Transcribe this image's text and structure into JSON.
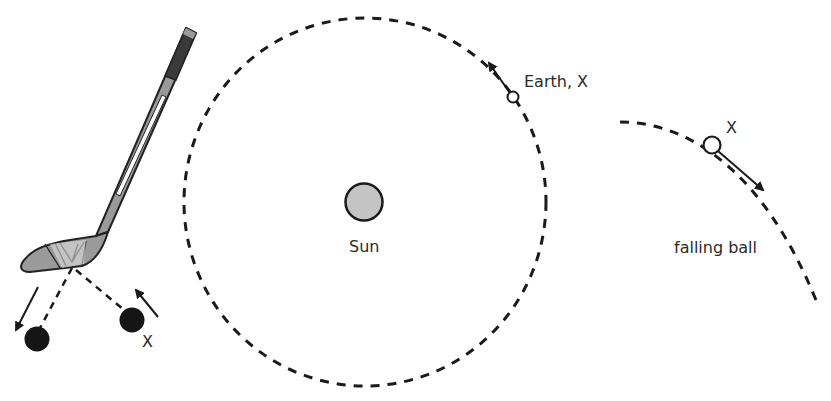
{
  "diagram": {
    "colors": {
      "line": "#1a1a1a",
      "sun_fill": "#c4c4c4",
      "stick_blade": "#9a9a9a",
      "stick_grip": "#3a3a3a",
      "text": "#2a2a2a"
    },
    "hockey": {
      "puck_x_label": "X"
    },
    "orbit": {
      "sun_label": "Sun",
      "earth_label": "Earth, X"
    },
    "falling": {
      "point_label": "X",
      "caption": "falling ball"
    }
  }
}
